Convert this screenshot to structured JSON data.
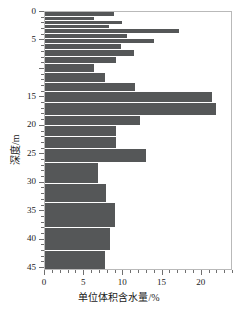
{
  "chart_data": {
    "type": "bar",
    "orientation": "horizontal",
    "title": "",
    "xlabel": "单位体积含水量/%",
    "ylabel": "深度/m",
    "xlim": [
      0,
      24
    ],
    "ylim": [
      0,
      45.5
    ],
    "y_inverted": true,
    "grid": false,
    "legend": null,
    "bar_color": "#555758",
    "frame_color": "#b9b9b9",
    "xticks": [
      0,
      5,
      10,
      15,
      20
    ],
    "xticklabels": [
      "0",
      "5",
      "10",
      "15",
      "20"
    ],
    "x_minor_step": 1,
    "yticks": [
      0,
      5,
      15,
      20,
      25,
      30,
      35,
      40,
      45
    ],
    "yticklabels": [
      "0",
      "5",
      "15",
      "20",
      "25",
      "30",
      "35",
      "40",
      "45"
    ],
    "y_minor_step": 1,
    "categories": [
      "0.5",
      "1.3",
      "2.0",
      "2.8",
      "3.6",
      "4.4",
      "5.3",
      "6.2",
      "7.3",
      "8.6",
      "10.0",
      "11.5",
      "13.2",
      "15.0",
      "17.0",
      "19.2",
      "21.0",
      "23.0",
      "25.6",
      "28.5",
      "31.5",
      "36.0",
      "40.5",
      "44.0"
    ],
    "depth_tops": [
      0.0,
      0.9,
      1.6,
      2.3,
      3.0,
      3.8,
      4.7,
      5.6,
      6.7,
      7.9,
      9.2,
      10.7,
      12.4,
      14.0,
      16.0,
      18.2,
      20.0,
      22.0,
      24.0,
      26.5,
      30.3,
      33.5,
      38.0,
      42.0
    ],
    "depth_bottoms": [
      0.9,
      1.6,
      2.3,
      3.0,
      3.8,
      4.7,
      5.6,
      6.7,
      7.9,
      9.2,
      10.7,
      12.4,
      14.0,
      16.0,
      18.2,
      20.0,
      22.0,
      24.0,
      26.5,
      30.3,
      33.5,
      38.0,
      42.0,
      45.3
    ],
    "values": [
      8.8,
      6.3,
      9.8,
      8.2,
      17.1,
      10.5,
      13.9,
      9.7,
      11.3,
      9.0,
      6.2,
      7.6,
      11.5,
      21.3,
      21.8,
      12.1,
      9.0,
      9.0,
      12.9,
      6.8,
      7.8,
      8.9,
      8.3,
      7.7
    ]
  }
}
